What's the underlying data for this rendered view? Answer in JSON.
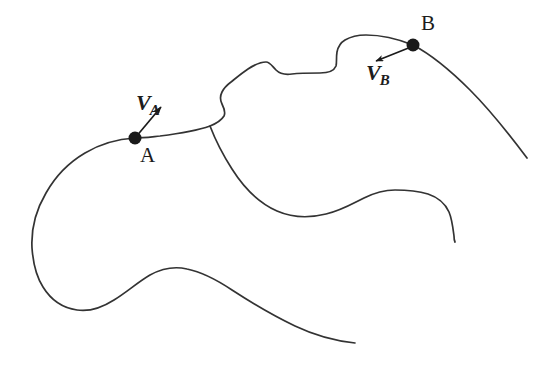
{
  "figure": {
    "background_color": "#ffffff",
    "stroke_color": "#333333",
    "marker_color": "#1a1a1a",
    "width": 553,
    "height": 365,
    "labels": {
      "point_a": "A",
      "point_b": "B",
      "vector_a_symbol": "V",
      "vector_a_subscript": "A",
      "vector_b_symbol": "V",
      "vector_b_subscript": "B"
    },
    "points": [
      {
        "name": "A",
        "x": 135,
        "y": 138,
        "radius": 6.5
      },
      {
        "name": "B",
        "x": 413,
        "y": 45,
        "radius": 6.5
      }
    ],
    "vectors": [
      {
        "name": "V_A",
        "from_x": 135,
        "from_y": 138,
        "to_x": 161,
        "to_y": 107
      },
      {
        "name": "V_B",
        "from_x": 411,
        "from_y": 47,
        "to_x": 376,
        "to_y": 61
      }
    ],
    "paths": {
      "main_outline": "M 527 158 C 512 138 492 112 470 90 C 450 70 432 55 413 45 C 398 39 381 35 366 35 C 357 35 350 37 345 40 C 340 43 338 47 337 52 C 336 58 337 62 336 66 C 334 71 329 73 320 73 C 310 73 300 73 292 74 C 285 75 280 74 276 70 C 272 66 270 62 266 62 C 260 62 254 65 248 69 C 242 73 236 78 231 82 C 227 85 224 88 222 92 C 220 96 220 100 222 104 C 224 108 226 112 224 116 C 221 121 215 124 210 126 C 196 131 176 134 160 136 C 150 137 142 138 135 138 C 118 139 100 144 85 153 C 68 163 55 177 46 193 C 36 210 31 230 32 248 C 33 262 36 276 43 287 C 51 300 63 308 77 310 C 90 312 103 307 114 300 C 127 292 138 282 150 275 C 161 269 174 266 187 269 C 202 272 217 280 232 290 C 252 303 274 316 295 326 C 316 336 336 341 355 343",
      "inner_branch": "M 210 126 C 215 139 223 155 232 169 C 244 188 259 203 277 211 C 293 218 310 218 326 214 C 340 211 352 204 364 198 C 374 193 384 190 395 190 C 407 190 418 191 428 194 C 437 197 445 203 449 212 C 452 219 453 228 454 236 C 454 239 454 240 455 242"
    }
  }
}
